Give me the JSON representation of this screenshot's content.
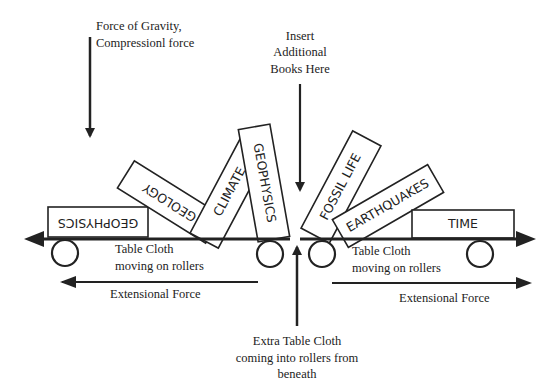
{
  "labels": {
    "gravity_line1": "Force of Gravity,",
    "gravity_line2": "Compressionl  force",
    "insert_line1": "Insert",
    "insert_line2": "Additional",
    "insert_line3": "Books Here",
    "cloth_left_line1": "Table Cloth",
    "cloth_left_line2": "moving on rollers",
    "cloth_right_line1": "Table Cloth",
    "cloth_right_line2": "moving on rollers",
    "ext_left": "Extensional Force",
    "ext_right": "Extensional Force",
    "extra_line1": "Extra Table Cloth",
    "extra_line2": "coming into rollers from",
    "extra_line3": "beneath"
  },
  "books": [
    {
      "label": "GEOPHYSICS",
      "orientation": "upside-down, flat, left"
    },
    {
      "label": "GEOLOGY",
      "orientation": "tilted, upside-down"
    },
    {
      "label": "CLIMATE",
      "orientation": "tilted, vertical"
    },
    {
      "label": "GEOPHYSICS",
      "orientation": "near vertical"
    },
    {
      "label": "FOSSIL LIFE",
      "orientation": "tilted right"
    },
    {
      "label": "EARTHQUAKES",
      "orientation": "tilted right"
    },
    {
      "label": "TIME",
      "orientation": "flat, right"
    }
  ],
  "colors": {
    "ink": "#222222",
    "background": "#ffffff"
  }
}
